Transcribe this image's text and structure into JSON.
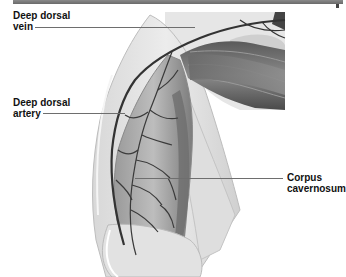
{
  "figure": {
    "type": "anatomical-illustration"
  },
  "labels": [
    {
      "id": "deep-dorsal-vein",
      "lines": [
        "Deep dorsal",
        "vein"
      ]
    },
    {
      "id": "deep-dorsal-artery",
      "lines": [
        "Deep dorsal",
        "artery"
      ]
    },
    {
      "id": "corpus-cavernosum",
      "lines": [
        "Corpus",
        "cavernosum"
      ]
    }
  ],
  "colors": {
    "header_bar": "#7a7a7a",
    "label_text": "#111111",
    "leader_line": "#6e6e6e",
    "vessel": "#3a3a3a"
  }
}
